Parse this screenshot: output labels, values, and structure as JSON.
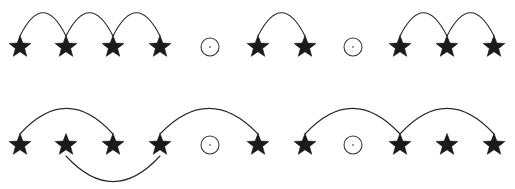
{
  "canvas": {
    "width": 515,
    "height": 189,
    "background": "#ffffff",
    "stroke_color": "#2b2b2b",
    "star_color": "#1a1a1a",
    "circle_color": "#3a3a3a"
  },
  "rows": [
    {
      "name": "top-row",
      "baseline_y": 47,
      "symbols": [
        {
          "index": 1,
          "type": "star",
          "x": 20,
          "label": "star"
        },
        {
          "index": 2,
          "type": "star",
          "x": 66,
          "label": "star"
        },
        {
          "index": 3,
          "type": "star",
          "x": 113,
          "label": "star"
        },
        {
          "index": 4,
          "type": "star",
          "x": 160,
          "label": "star"
        },
        {
          "index": 5,
          "type": "circle",
          "x": 210,
          "label": "circle"
        },
        {
          "index": 6,
          "type": "star",
          "x": 258,
          "label": "star"
        },
        {
          "index": 7,
          "type": "star",
          "x": 305,
          "label": "star"
        },
        {
          "index": 8,
          "type": "circle",
          "x": 353,
          "label": "circle"
        },
        {
          "index": 9,
          "type": "star",
          "x": 400,
          "label": "star"
        },
        {
          "index": 10,
          "type": "star",
          "x": 447,
          "label": "star"
        },
        {
          "index": 11,
          "type": "star",
          "x": 494,
          "label": "star"
        }
      ],
      "arcs": [
        {
          "from": 1,
          "to": 2,
          "side": "above",
          "height": 30
        },
        {
          "from": 2,
          "to": 3,
          "side": "above",
          "height": 30
        },
        {
          "from": 3,
          "to": 4,
          "side": "above",
          "height": 30
        },
        {
          "from": 6,
          "to": 7,
          "side": "above",
          "height": 30
        },
        {
          "from": 9,
          "to": 10,
          "side": "above",
          "height": 30
        },
        {
          "from": 10,
          "to": 11,
          "side": "above",
          "height": 30
        }
      ]
    },
    {
      "name": "bottom-row",
      "baseline_y": 145,
      "symbols": [
        {
          "index": 1,
          "type": "star",
          "x": 20,
          "label": "star"
        },
        {
          "index": 2,
          "type": "star",
          "x": 66,
          "label": "star"
        },
        {
          "index": 3,
          "type": "star",
          "x": 113,
          "label": "star"
        },
        {
          "index": 4,
          "type": "star",
          "x": 160,
          "label": "star"
        },
        {
          "index": 5,
          "type": "circle",
          "x": 210,
          "label": "circle"
        },
        {
          "index": 6,
          "type": "star",
          "x": 258,
          "label": "star"
        },
        {
          "index": 7,
          "type": "star",
          "x": 305,
          "label": "star"
        },
        {
          "index": 8,
          "type": "circle",
          "x": 353,
          "label": "circle"
        },
        {
          "index": 9,
          "type": "star",
          "x": 400,
          "label": "star"
        },
        {
          "index": 10,
          "type": "star",
          "x": 447,
          "label": "star"
        },
        {
          "index": 11,
          "type": "star",
          "x": 494,
          "label": "star"
        }
      ],
      "arcs": [
        {
          "from": 1,
          "to": 3,
          "side": "above",
          "height": 33
        },
        {
          "from": 2,
          "to": 4,
          "side": "below",
          "height": 33
        },
        {
          "from": 4,
          "to": 6,
          "side": "above",
          "height": 33
        },
        {
          "from": 7,
          "to": 9,
          "side": "above",
          "height": 33
        },
        {
          "from": 9,
          "to": 11,
          "side": "above",
          "height": 33
        }
      ]
    }
  ],
  "glyph": {
    "star_radius": 11.5,
    "star_inner_ratio": 0.42,
    "circle_radius": 9,
    "circle_center_dot_radius": 0.9
  }
}
